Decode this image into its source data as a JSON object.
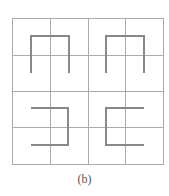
{
  "figure": {
    "caption": "(b)",
    "grid": {
      "x_lines": [
        12,
        50,
        88,
        125,
        163
      ],
      "y_lines": [
        18,
        55,
        91,
        127,
        164
      ],
      "color": "#aaaaaa"
    },
    "shapes": [
      {
        "name": "shape-top-left-cap",
        "orientation": "opening-down",
        "points": "31,73 31,36 69,36 69,73"
      },
      {
        "name": "shape-top-right-cap",
        "orientation": "opening-down",
        "points": "106,73 106,36 144,36 144,73"
      },
      {
        "name": "shape-bottom-left-bracket",
        "orientation": "opening-left",
        "points": "31,108 68,108 68,145 31,145"
      },
      {
        "name": "shape-bottom-right-bracket",
        "orientation": "opening-right",
        "points": "144,108 106,108 106,145 144,145"
      }
    ],
    "shape_color": "#888888"
  }
}
